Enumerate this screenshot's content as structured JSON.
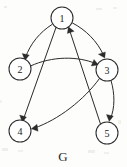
{
  "figure": {
    "caption": "G",
    "kind": "directed-graph",
    "width": 127,
    "height": 167,
    "background_color": "#fdfdfb",
    "stroke_color": "#2b2b2b"
  },
  "nodes": [
    {
      "id": "1",
      "label": "1",
      "cx": 62,
      "cy": 18,
      "r": 11
    },
    {
      "id": "2",
      "label": "2",
      "cx": 20,
      "cy": 69,
      "r": 11
    },
    {
      "id": "3",
      "label": "3",
      "cx": 107,
      "cy": 70,
      "r": 11
    },
    {
      "id": "4",
      "label": "4",
      "cx": 20,
      "cy": 131,
      "r": 11
    },
    {
      "id": "5",
      "label": "5",
      "cx": 107,
      "cy": 133,
      "r": 11
    }
  ],
  "edges": [
    {
      "id": "e1",
      "from": "1",
      "to": "2",
      "style": "curved",
      "label": "1 to 2"
    },
    {
      "id": "e2",
      "from": "1",
      "to": "3",
      "style": "curved",
      "label": "1 to 3"
    },
    {
      "id": "e3",
      "from": "2",
      "to": "3",
      "style": "curved",
      "label": "2 to 3"
    },
    {
      "id": "e4",
      "from": "1",
      "to": "4",
      "style": "straight",
      "label": "1 to 4"
    },
    {
      "id": "e5",
      "from": "3",
      "to": "4",
      "style": "curved",
      "label": "3 to 4"
    },
    {
      "id": "e6",
      "from": "3",
      "to": "5",
      "style": "curved",
      "label": "3 to 5"
    },
    {
      "id": "e7",
      "from": "5",
      "to": "1",
      "style": "straight",
      "label": "5 to 1"
    }
  ]
}
